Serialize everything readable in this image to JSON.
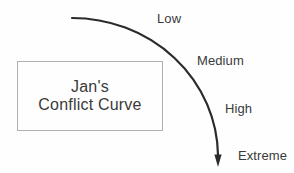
{
  "diagram": {
    "title": {
      "line1": "Jan's",
      "line2": "Conflict Curve"
    },
    "curve_labels": [
      {
        "text": "Low"
      },
      {
        "text": "Medium"
      },
      {
        "text": "High"
      },
      {
        "text": "Extreme"
      }
    ],
    "levels_in_order": [
      "Low",
      "Medium",
      "High",
      "Extreme"
    ]
  },
  "colors": {
    "ink": "#2b2b2b",
    "text": "#3a3a3a",
    "box_border": "#b0b0b0",
    "background": "#fefefe"
  }
}
